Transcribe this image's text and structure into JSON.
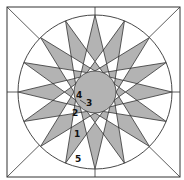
{
  "diagram": {
    "colors": {
      "background": "#ffffff",
      "fill": "#b3b3b3",
      "stroke": "#333333"
    },
    "square": {
      "x": 7,
      "y": 7,
      "w": 173,
      "h": 170
    },
    "center": {
      "x": 95,
      "y": 92
    },
    "outer_circle_r": 77,
    "inner_circle_r": 21,
    "spike_count": 16,
    "spike_base_offset_deg": 45,
    "labels": [
      {
        "text": "4",
        "x": 76,
        "y": 91
      },
      {
        "text": "3",
        "x": 86,
        "y": 99
      },
      {
        "text": "2",
        "x": 72,
        "y": 109
      },
      {
        "text": "1",
        "x": 74,
        "y": 130
      },
      {
        "text": "5",
        "x": 75,
        "y": 155
      }
    ]
  }
}
